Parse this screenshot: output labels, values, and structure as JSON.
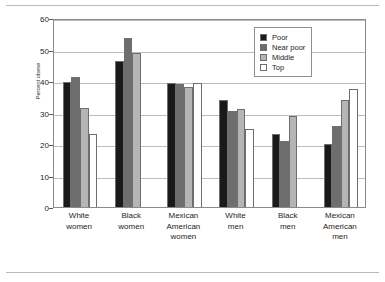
{
  "chart_data": {
    "type": "bar",
    "title": "",
    "xlabel": "",
    "ylabel": "Percent obese",
    "ylim": [
      0,
      60
    ],
    "ytick_step": 10,
    "yticks": [
      0,
      10,
      20,
      30,
      40,
      50,
      60
    ],
    "grid": true,
    "legend_position": "top-right",
    "categories": [
      "White women",
      "Black women",
      "Mexican American women",
      "White men",
      "Black men",
      "Mexican American men"
    ],
    "category_lines": [
      [
        "White",
        "women"
      ],
      [
        "Black",
        "women"
      ],
      [
        "Mexican",
        "American",
        "women"
      ],
      [
        "White",
        "men"
      ],
      [
        "Black",
        "men"
      ],
      [
        "Mexican",
        "American",
        "men"
      ]
    ],
    "series": [
      {
        "name": "Poor",
        "color": "#1a1a1a",
        "values": [
          39.8,
          46.5,
          39.4,
          34.0,
          23.3,
          20.0
        ]
      },
      {
        "name": "Near poor",
        "color": "#6e6e6e",
        "values": [
          41.3,
          53.8,
          38.9,
          30.4,
          21.0,
          25.6
        ]
      },
      {
        "name": "Middle",
        "color": "#b5b5b5",
        "values": [
          31.3,
          49.0,
          38.0,
          31.0,
          28.8,
          34.0
        ]
      },
      {
        "name": "Top",
        "color": "#ffffff",
        "values": [
          23.3,
          null,
          39.5,
          24.9,
          null,
          37.5
        ]
      }
    ]
  },
  "legend": {
    "items": [
      {
        "label": "Poor",
        "color": "#1a1a1a"
      },
      {
        "label": "Near poor",
        "color": "#6e6e6e"
      },
      {
        "label": "Middle",
        "color": "#b5b5b5"
      },
      {
        "label": "Top",
        "color": "#ffffff"
      }
    ]
  },
  "axis": {
    "y_label": "Percent obese",
    "y_tick_labels": [
      "0",
      "10",
      "20",
      "30",
      "40",
      "50",
      "60"
    ]
  }
}
